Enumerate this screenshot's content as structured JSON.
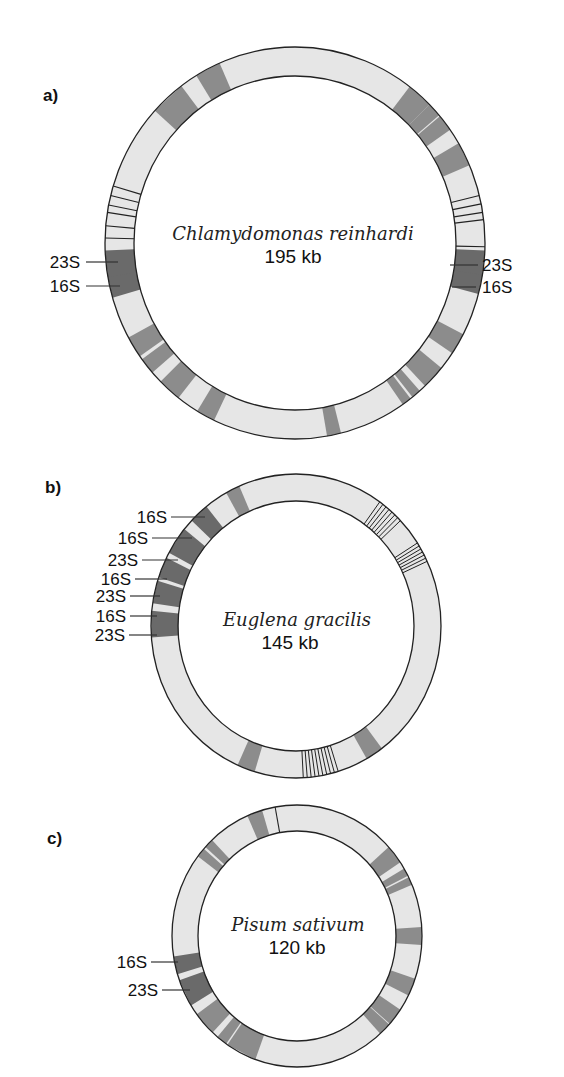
{
  "figure": {
    "panels": [
      {
        "id": "a",
        "label": "a)",
        "species": "Chlamydomonas reinhardi",
        "genome_size": "195 kb",
        "bands": [
          {
            "pos": 0.924,
            "span": 0.022,
            "tone": "gene"
          },
          {
            "pos": 0.883,
            "span": 0.03,
            "tone": "gene"
          },
          {
            "pos": 0.114,
            "span": 0.022,
            "tone": "gene"
          },
          {
            "pos": 0.131,
            "span": 0.012,
            "tone": "gene"
          },
          {
            "pos": 0.145,
            "span": 0.014,
            "tone": "gene"
          },
          {
            "pos": 0.175,
            "span": 0.02,
            "tone": "gene"
          },
          {
            "pos": 0.267,
            "span": 0.022,
            "tone": "rrna"
          },
          {
            "pos": 0.284,
            "span": 0.016,
            "tone": "rrna"
          },
          {
            "pos": 0.336,
            "span": 0.018,
            "tone": "gene"
          },
          {
            "pos": 0.37,
            "span": 0.02,
            "tone": "gene"
          },
          {
            "pos": 0.39,
            "span": 0.008,
            "tone": "gene"
          },
          {
            "pos": 0.4,
            "span": 0.008,
            "tone": "gene"
          },
          {
            "pos": 0.467,
            "span": 0.012,
            "tone": "gene"
          },
          {
            "pos": 0.578,
            "span": 0.016,
            "tone": "gene"
          },
          {
            "pos": 0.615,
            "span": 0.02,
            "tone": "gene"
          },
          {
            "pos": 0.642,
            "span": 0.014,
            "tone": "gene"
          },
          {
            "pos": 0.661,
            "span": 0.018,
            "tone": "gene"
          },
          {
            "pos": 0.714,
            "span": 0.018,
            "tone": "rrna"
          },
          {
            "pos": 0.733,
            "span": 0.022,
            "tone": "rrna"
          }
        ],
        "lines": [
          0.211,
          0.218,
          0.225,
          0.231,
          0.253,
          0.754,
          0.764,
          0.775,
          0.781,
          0.789,
          0.797
        ],
        "labels_left": [
          {
            "text": "23S",
            "pos": 0.733
          },
          {
            "text": "16S",
            "pos": 0.714
          }
        ],
        "labels_right": [
          {
            "text": "23S",
            "pos": 0.267
          },
          {
            "text": "16S",
            "pos": 0.284
          }
        ]
      },
      {
        "id": "b",
        "label": "b)",
        "species": "Euglena gracilis",
        "genome_size": "145 kb",
        "bands": [
          {
            "pos": 0.928,
            "span": 0.016,
            "tone": "gene"
          },
          {
            "pos": 0.883,
            "span": 0.022,
            "tone": "rrna"
          },
          {
            "pos": 0.845,
            "span": 0.03,
            "tone": "rrna"
          },
          {
            "pos": 0.813,
            "span": 0.022,
            "tone": "rrna"
          },
          {
            "pos": 0.786,
            "span": 0.024,
            "tone": "rrna"
          },
          {
            "pos": 0.752,
            "span": 0.028,
            "tone": "rrna"
          },
          {
            "pos": 0.409,
            "span": 0.02,
            "tone": "gene"
          },
          {
            "pos": 0.556,
            "span": 0.02,
            "tone": "gene"
          }
        ],
        "line_clusters": [
          {
            "from": 0.098,
            "to": 0.128,
            "count": 8
          },
          {
            "from": 0.158,
            "to": 0.18,
            "count": 7
          },
          {
            "from": 0.453,
            "to": 0.492,
            "count": 10
          }
        ],
        "labels_left": [
          {
            "text": "16S",
            "pos": 0.883
          },
          {
            "text": "16S",
            "pos": 0.858
          },
          {
            "text": "23S",
            "pos": 0.835
          },
          {
            "text": "16S",
            "pos": 0.813
          },
          {
            "text": "23S",
            "pos": 0.793
          },
          {
            "text": "16S",
            "pos": 0.771
          },
          {
            "text": "23S",
            "pos": 0.75
          }
        ]
      },
      {
        "id": "c",
        "label": "c)",
        "species": "Pisum sativum",
        "genome_size": "120 kb",
        "bands": [
          {
            "pos": 0.945,
            "span": 0.02,
            "tone": "gene"
          },
          {
            "pos": 0.875,
            "span": 0.012,
            "tone": "gene"
          },
          {
            "pos": 0.86,
            "span": 0.012,
            "tone": "gene"
          },
          {
            "pos": 0.143,
            "span": 0.024,
            "tone": "gene"
          },
          {
            "pos": 0.169,
            "span": 0.01,
            "tone": "gene"
          },
          {
            "pos": 0.181,
            "span": 0.01,
            "tone": "gene"
          },
          {
            "pos": 0.25,
            "span": 0.022,
            "tone": "gene"
          },
          {
            "pos": 0.314,
            "span": 0.022,
            "tone": "gene"
          },
          {
            "pos": 0.356,
            "span": 0.022,
            "tone": "gene"
          },
          {
            "pos": 0.376,
            "span": 0.016,
            "tone": "gene"
          },
          {
            "pos": 0.574,
            "span": 0.04,
            "tone": "gene"
          },
          {
            "pos": 0.603,
            "span": 0.014,
            "tone": "gene"
          },
          {
            "pos": 0.633,
            "span": 0.03,
            "tone": "gene"
          },
          {
            "pos": 0.678,
            "span": 0.034,
            "tone": "rrna"
          },
          {
            "pos": 0.714,
            "span": 0.022,
            "tone": "rrna"
          }
        ],
        "lines": [
          0.972
        ],
        "labels_left": [
          {
            "text": "16S",
            "pos": 0.714
          },
          {
            "text": "23S",
            "pos": 0.678
          }
        ]
      }
    ],
    "colors": {
      "ring": "#e6e6e6",
      "gene": "#8c8c8c",
      "rrna": "#6a6a6a",
      "outline": "#222222"
    }
  }
}
